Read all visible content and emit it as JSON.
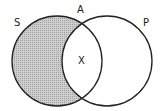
{
  "diagram": {
    "type": "venn",
    "labels": {
      "left_set": "S",
      "right_set": "P",
      "top": "A",
      "intersection": "X"
    },
    "shaded_region": "S only (S minus P)",
    "colors": {
      "stroke": "#222222",
      "shade": "#bdbdbd",
      "background": "#ffffff"
    }
  }
}
